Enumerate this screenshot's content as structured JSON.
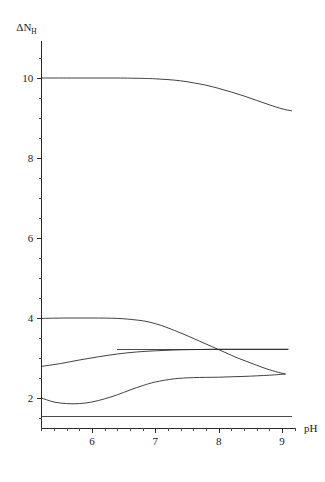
{
  "chart_data": {
    "type": "line",
    "title": "",
    "subtitle": "",
    "xlabel": "pH",
    "ylabel": "ΔN",
    "ylabel_base": "ΔN",
    "ylabel_subscript": "H",
    "xlim": [
      5.2,
      9.25
    ],
    "ylim": [
      1.2,
      11.0
    ],
    "xticks": [
      6,
      7,
      8,
      9
    ],
    "xticklabels": [
      "6",
      "7",
      "8",
      "9"
    ],
    "yticks": [
      2,
      4,
      6,
      8,
      10
    ],
    "yticklabels": [
      "2",
      "4",
      "6",
      "8",
      "10"
    ],
    "x_minor_tick_step": 0.2,
    "y_minor_tick_step": 0.5,
    "grid": false,
    "legend": "none",
    "axis_color": "#2b2b2b",
    "curve_color": "#1f1f1f",
    "background_color": "#ffffff",
    "series": [
      {
        "name": "curve-top",
        "description": "Upper curve, flat near 10 then declining after pH 7.5",
        "x": [
          5.2,
          5.6,
          6.0,
          6.4,
          6.8,
          7.0,
          7.2,
          7.4,
          7.6,
          7.8,
          8.0,
          8.2,
          8.4,
          8.6,
          8.8,
          9.0,
          9.15
        ],
        "y": [
          10.0,
          10.0,
          10.0,
          10.0,
          9.99,
          9.98,
          9.96,
          9.93,
          9.88,
          9.82,
          9.74,
          9.65,
          9.55,
          9.44,
          9.33,
          9.23,
          9.18
        ]
      },
      {
        "name": "curve-upper-mid-declining",
        "description": "Starts near 4.0, plateau to pH 6.7, declines through crossing at pH 8.2 to about 2.6",
        "x": [
          5.2,
          5.6,
          6.0,
          6.4,
          6.7,
          6.9,
          7.1,
          7.3,
          7.5,
          7.7,
          7.9,
          8.1,
          8.3,
          8.5,
          8.7,
          8.9,
          9.05
        ],
        "y": [
          3.99,
          4.0,
          4.0,
          3.99,
          3.95,
          3.9,
          3.81,
          3.69,
          3.56,
          3.42,
          3.28,
          3.14,
          3.0,
          2.88,
          2.76,
          2.66,
          2.6
        ]
      },
      {
        "name": "curve-middle-rising",
        "description": "Rises from about 2.8 at pH 5.2 up to a plateau near 3.2",
        "x": [
          5.2,
          5.5,
          5.8,
          6.1,
          6.4,
          6.7,
          7.0,
          7.3,
          7.6,
          8.0,
          8.4,
          8.8,
          9.1
        ],
        "y": [
          2.79,
          2.86,
          2.95,
          3.03,
          3.1,
          3.15,
          3.18,
          3.2,
          3.21,
          3.22,
          3.22,
          3.22,
          3.22
        ]
      },
      {
        "name": "curve-lower-dip-rise",
        "description": "Starts near 2.0, dips to about 1.85 near pH 5.7, rises to plateau about 2.5 then to 2.6",
        "x": [
          5.2,
          5.4,
          5.6,
          5.8,
          6.0,
          6.2,
          6.4,
          6.6,
          6.8,
          7.0,
          7.3,
          7.6,
          8.0,
          8.4,
          8.8,
          9.05
        ],
        "y": [
          2.0,
          1.9,
          1.86,
          1.86,
          1.9,
          1.98,
          2.08,
          2.2,
          2.31,
          2.4,
          2.48,
          2.51,
          2.52,
          2.54,
          2.57,
          2.6
        ]
      },
      {
        "name": "line-flat-upper",
        "description": "Horizontal reference line at about 3.2",
        "x": [
          6.4,
          9.1
        ],
        "y": [
          3.21,
          3.21
        ]
      },
      {
        "name": "line-flat-lower",
        "description": "Horizontal reference line at about 1.55",
        "x": [
          5.2,
          9.15
        ],
        "y": [
          1.55,
          1.55
        ]
      }
    ]
  }
}
